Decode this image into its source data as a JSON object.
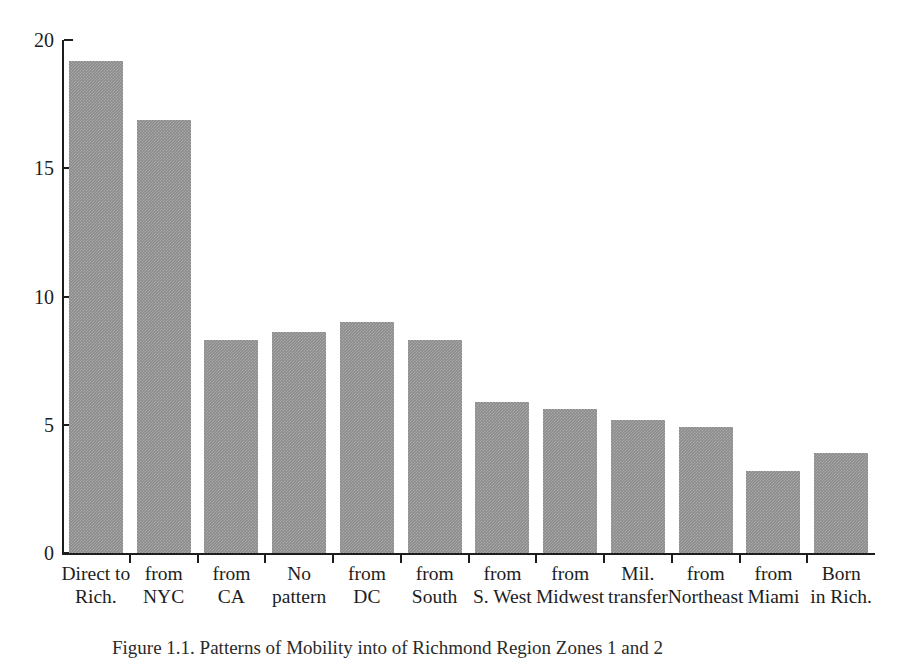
{
  "chart_data": {
    "type": "bar",
    "title": "",
    "xlabel": "",
    "ylabel": "",
    "ylim": [
      0,
      20
    ],
    "yticks": [
      0,
      5,
      10,
      15,
      20
    ],
    "grid": false,
    "legend": null,
    "bar_color": "#8c8c8c",
    "axis_color": "#1d1d1d",
    "categories": [
      "Direct to Rich.",
      "from NYC",
      "from CA",
      "No pattern",
      "from DC",
      "from South",
      "from S. West",
      "from Midwest",
      "Mil. transfer",
      "from Northeast",
      "from Miami",
      "Born in Rich."
    ],
    "category_lines": [
      [
        "Direct to",
        "Rich."
      ],
      [
        "from",
        "NYC"
      ],
      [
        "from",
        "CA"
      ],
      [
        "No",
        "pattern"
      ],
      [
        "from",
        "DC"
      ],
      [
        "from",
        "South"
      ],
      [
        "from",
        "S. West"
      ],
      [
        "from",
        "Midwest"
      ],
      [
        "Mil.",
        "transfer"
      ],
      [
        "from",
        "Northeast"
      ],
      [
        "from",
        "Miami"
      ],
      [
        "Born",
        "in Rich."
      ]
    ],
    "values": [
      19.2,
      16.9,
      8.3,
      8.6,
      9.0,
      8.3,
      5.9,
      5.6,
      5.2,
      4.9,
      3.2,
      3.9
    ]
  },
  "caption": {
    "text": "Figure 1.1. Patterns of Mobility into of Richmond Region Zones 1 and 2"
  }
}
